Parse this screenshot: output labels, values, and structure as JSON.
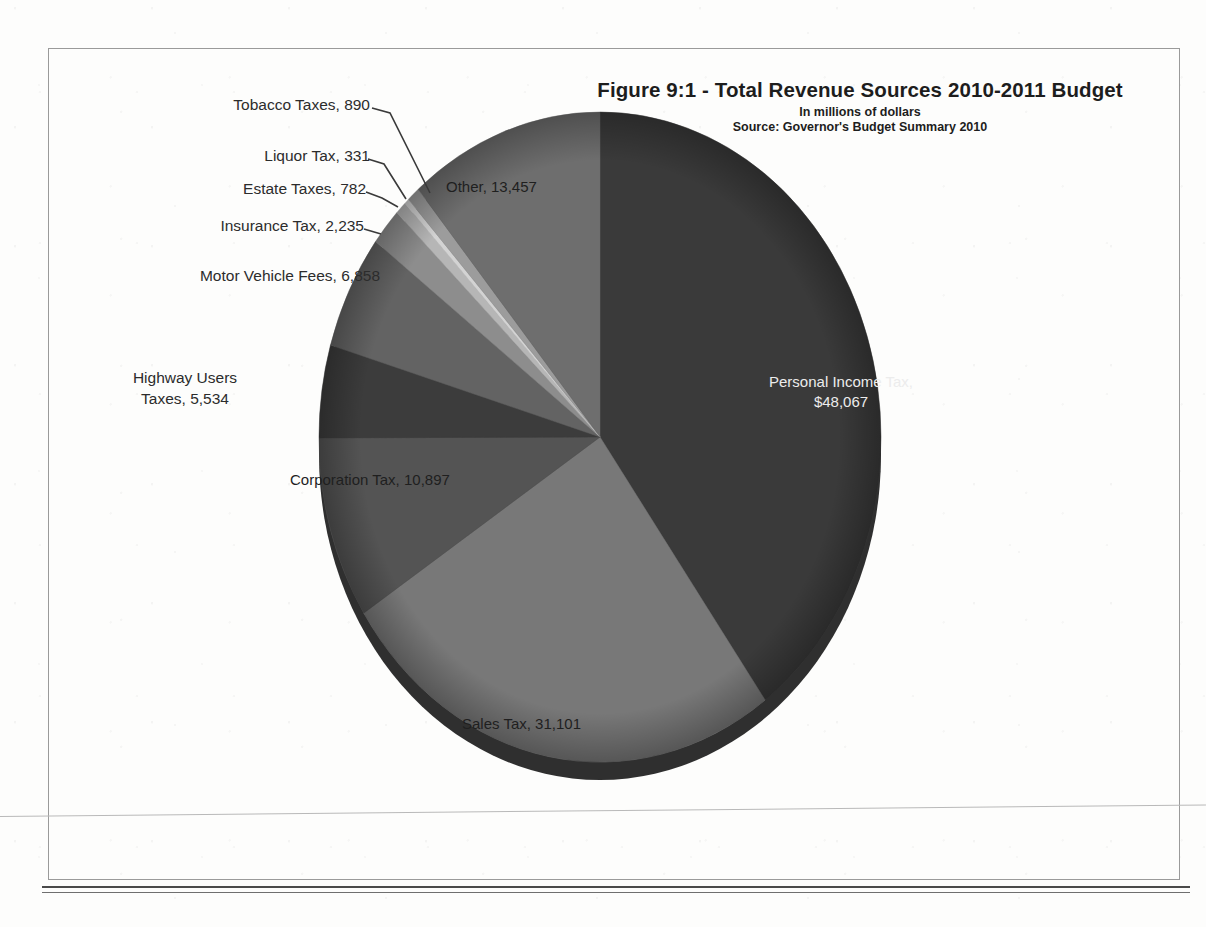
{
  "page": {
    "border_color": "#9a9a9a",
    "background": "#fdfdfc"
  },
  "header": {
    "title": "Figure 9:1   - Total Revenue Sources  2010-2011 Budget",
    "subtitle": "In millions of dollars",
    "source": "Source: Governor's Budget Summary 2010"
  },
  "labels": {
    "tobacco": "Tobacco Taxes, 890",
    "liquor": "Liquor Tax, 331",
    "estate": "Estate Taxes, 782",
    "insurance": "Insurance Tax, 2,235",
    "motor_vehicle": "Motor Vehicle Fees, 6,858",
    "highway_line1": "Highway Users",
    "highway_line2": "Taxes, 5,534",
    "corporation": "Corporation Tax, 10,897",
    "sales": "Sales Tax, 31,101",
    "other": "Other, 13,457",
    "personal_line1": "Personal Income Tax,",
    "personal_line2": "$48,067"
  },
  "chart_data": {
    "type": "pie",
    "title": "Figure 9:1   - Total Revenue Sources  2010-2011 Budget",
    "subtitle": "In millions of dollars",
    "source": "Source: Governor's Budget Summary 2010",
    "units": "millions of dollars",
    "total": 120152,
    "start_angle_deg": 0,
    "direction": "clockwise",
    "legend": "none (direct labels)",
    "categories": [
      "Personal Income Tax",
      "Sales Tax",
      "Corporation Tax",
      "Highway Users Taxes",
      "Motor Vehicle Fees",
      "Insurance Tax",
      "Estate Taxes",
      "Liquor Tax",
      "Tobacco Taxes",
      "Other"
    ],
    "values": [
      48067,
      31101,
      10897,
      5534,
      6858,
      2235,
      782,
      331,
      890,
      13457
    ],
    "value_labels": [
      "$48,067",
      "31,101",
      "10,897",
      "5,534",
      "6,858",
      "2,235",
      "782",
      "331",
      "890",
      "13,457"
    ],
    "colors": [
      "#3a3a3a",
      "#787878",
      "#545454",
      "#3c3c3c",
      "#636363",
      "#8d8d8d",
      "#b6b6b6",
      "#d3d3d3",
      "#9c9c9c",
      "#6e6e6e"
    ],
    "slices": [
      {
        "label": "Personal Income Tax",
        "value": 48067,
        "display": "$48,067",
        "percent": 40.0,
        "color": "#3a3a3a",
        "label_placement": "inside",
        "label_color": "#ececec"
      },
      {
        "label": "Sales Tax",
        "value": 31101,
        "display": "31,101",
        "percent": 25.9,
        "color": "#787878",
        "label_placement": "inside",
        "label_color": "#1f1f1f"
      },
      {
        "label": "Corporation Tax",
        "value": 10897,
        "display": "10,897",
        "percent": 9.1,
        "color": "#545454",
        "label_placement": "inside",
        "label_color": "#1f1f1f"
      },
      {
        "label": "Highway Users Taxes",
        "value": 5534,
        "display": "5,534",
        "percent": 4.6,
        "color": "#3c3c3c",
        "label_placement": "outside",
        "label_color": "#2c2c2c"
      },
      {
        "label": "Motor Vehicle Fees",
        "value": 6858,
        "display": "6,858",
        "percent": 5.7,
        "color": "#636363",
        "label_placement": "outside",
        "label_color": "#2c2c2c"
      },
      {
        "label": "Insurance Tax",
        "value": 2235,
        "display": "2,235",
        "percent": 1.9,
        "color": "#8d8d8d",
        "label_placement": "outside-leader",
        "label_color": "#2c2c2c"
      },
      {
        "label": "Estate Taxes",
        "value": 782,
        "display": "782",
        "percent": 0.7,
        "color": "#b6b6b6",
        "label_placement": "outside-leader",
        "label_color": "#2c2c2c"
      },
      {
        "label": "Liquor Tax",
        "value": 331,
        "display": "331",
        "percent": 0.3,
        "color": "#d3d3d3",
        "label_placement": "outside-leader",
        "label_color": "#2c2c2c"
      },
      {
        "label": "Tobacco Taxes",
        "value": 890,
        "display": "890",
        "percent": 0.7,
        "color": "#9c9c9c",
        "label_placement": "outside-leader",
        "label_color": "#2c2c2c"
      },
      {
        "label": "Other",
        "value": 13457,
        "display": "13,457",
        "percent": 11.2,
        "color": "#6e6e6e",
        "label_placement": "inside",
        "label_color": "#1f1f1f"
      }
    ]
  }
}
